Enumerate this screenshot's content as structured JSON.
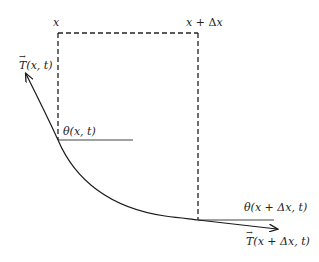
{
  "diagram": {
    "type": "string-element-tension",
    "labels": {
      "x_left": "x",
      "x_right_var": "x",
      "x_right_op": " + Δ",
      "x_right_var2": "x",
      "tension_left_T": "T",
      "tension_left_args": "(x, t)",
      "theta_left": "θ(x, t)",
      "theta_right": "θ(x + Δx, t)",
      "tension_right_T": "T",
      "tension_right_args": "(x + Δx, t)",
      "vector_arrow": "→"
    },
    "colors": {
      "stroke": "#1a1a1a",
      "dashed": "#222222",
      "reference_line": "#444444",
      "background": "#ffffff"
    },
    "geometry": {
      "dashed_box": {
        "left_x": 58,
        "right_x": 198,
        "top_y": 33,
        "left_bottom_y": 140,
        "right_bottom_y": 220
      },
      "left_reference_line": {
        "x1": 58,
        "y1": 140,
        "x2": 133,
        "y2": 140
      },
      "right_reference_line": {
        "x1": 198,
        "y1": 220,
        "x2": 274,
        "y2": 220
      },
      "curve_start_arrow": {
        "x": 26,
        "y": 74
      },
      "curve_end_arrow": {
        "x": 277,
        "y": 229
      }
    }
  }
}
